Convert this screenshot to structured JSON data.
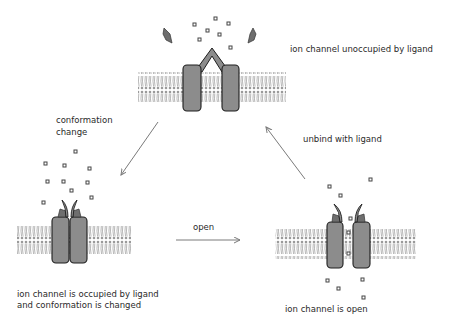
{
  "diagram": {
    "states": [
      {
        "id": "unoccupied",
        "label": "ion channel unoccupied by ligand"
      },
      {
        "id": "occupied",
        "label_lines": [
          "ion channel is occupied by ligand",
          "and conformation is changed"
        ]
      },
      {
        "id": "open",
        "label": "ion channel is open"
      }
    ],
    "transitions": [
      {
        "from": "unoccupied",
        "to": "occupied",
        "label_lines": [
          "conformation",
          "change"
        ]
      },
      {
        "from": "occupied",
        "to": "open",
        "label": "open"
      },
      {
        "from": "open",
        "to": "unoccupied",
        "label": "unbind with ligand"
      }
    ],
    "colors": {
      "channel_fill": "#8c8c8c",
      "channel_stroke": "#1e1e1e",
      "ligand_fill": "#6e6e6e",
      "membrane": "#9a9a9a",
      "arrow": "#7a7a7a",
      "ion_dot": "#555555"
    }
  }
}
